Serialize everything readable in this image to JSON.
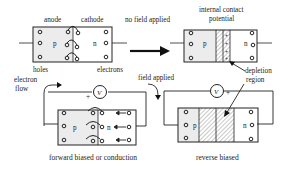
{
  "labels": {
    "anode": "anode",
    "cathode": "cathode",
    "no_field": "no field applied",
    "internal_contact_1": "internal contact",
    "internal_contact_2": "potential",
    "holes": "holes",
    "electrons": "electrons",
    "electron_flow_1": "electron",
    "electron_flow_2": "flow",
    "field_applied": "field applied",
    "depletion_1": "depletion",
    "depletion_2": "region",
    "forward_caption": "forward biased or conduction",
    "reverse_caption": "reverse biased",
    "p": "p",
    "n": "n",
    "voltmeter": "V",
    "plus": "+"
  },
  "colors": {
    "line": "#222222",
    "p_fill": "#ececec",
    "n_fill": "#ffffff",
    "hatch": "#777777"
  }
}
